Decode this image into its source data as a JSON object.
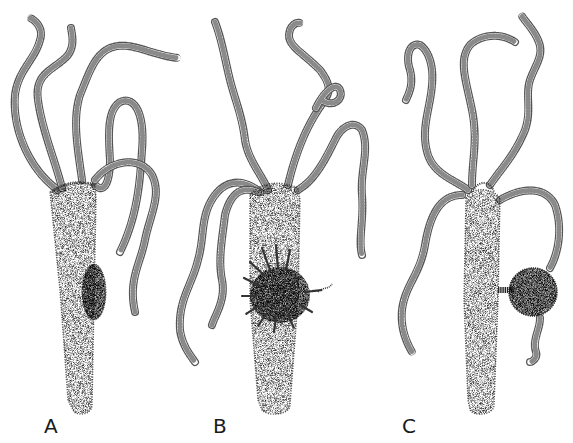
{
  "figure": {
    "panels": [
      {
        "label": "A",
        "feature": "early bud (oval swelling on body column)"
      },
      {
        "label": "B",
        "feature": "bud developing tentacles"
      },
      {
        "label": "C",
        "feature": "spherical bud with tentacle attached"
      }
    ]
  },
  "colors": {
    "background": "#ffffff",
    "ink": "#1a1a1a"
  }
}
